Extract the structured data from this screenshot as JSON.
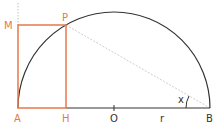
{
  "diagram": {
    "colors": {
      "arc": "#333333",
      "rectangle": "#e8784a",
      "label_points": "#e8784a",
      "label_other": "#333333",
      "dotted": "#c8c8c8",
      "baseline": "#333333"
    },
    "points": {
      "A": {
        "label": "A",
        "x": 18,
        "y": 108
      },
      "H": {
        "label": "H",
        "x": 66,
        "y": 108
      },
      "O": {
        "label": "O",
        "x": 114,
        "y": 108
      },
      "B": {
        "label": "B",
        "x": 210,
        "y": 108
      },
      "P": {
        "label": "P",
        "x": 66,
        "y": 25
      },
      "M": {
        "label": "M",
        "x": 18,
        "y": 25
      }
    },
    "radius_label": "r",
    "angle_label": "x"
  }
}
